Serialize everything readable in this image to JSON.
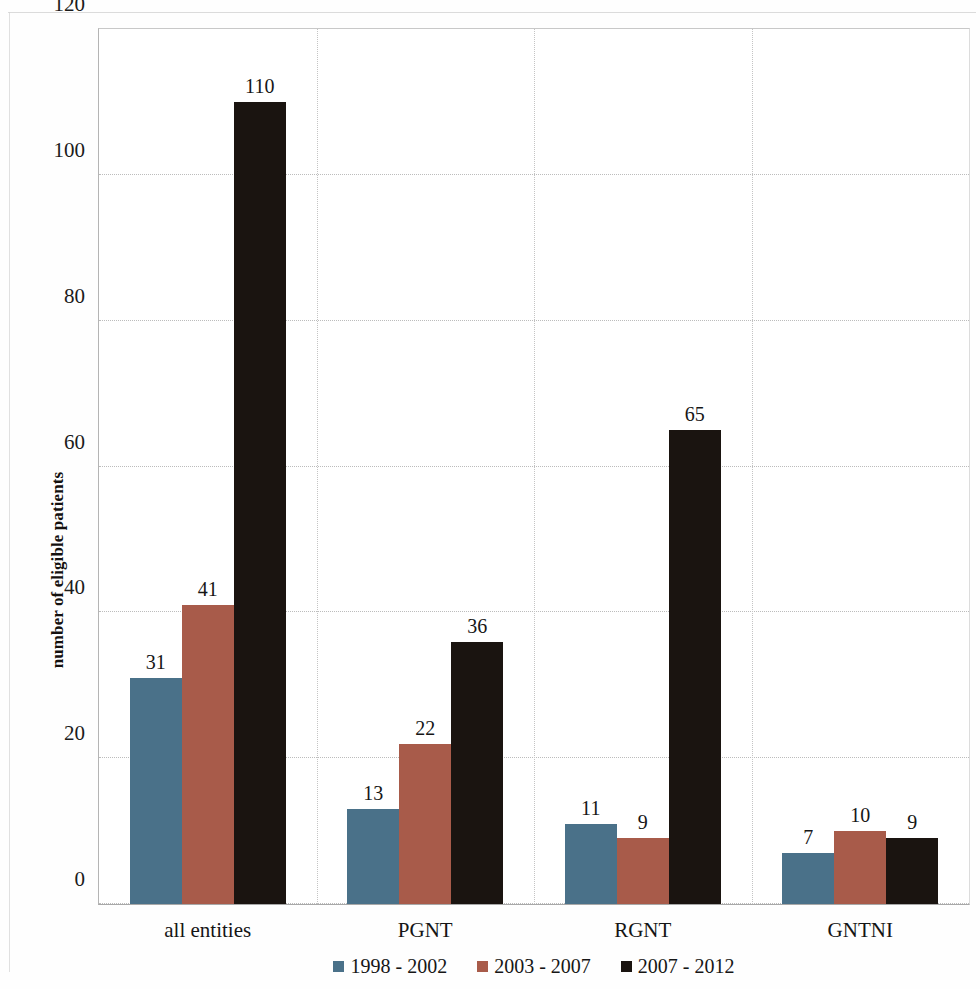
{
  "chart_data": {
    "type": "bar",
    "title": "",
    "subtitle": "",
    "xlabel": "",
    "ylabel": "number of eligible patients",
    "categories": [
      "all  entities",
      "PGNT",
      "RGNT",
      "GNTNI"
    ],
    "series": [
      {
        "name": "1998 - 2002",
        "color": "#4a7189",
        "values": [
          31,
          13,
          11,
          7
        ]
      },
      {
        "name": "2003 - 2007",
        "color": "#a85b4a",
        "values": [
          41,
          22,
          9,
          10
        ]
      },
      {
        "name": "2007 - 2012",
        "color": "#1a1410",
        "values": [
          110,
          36,
          65,
          9
        ]
      }
    ],
    "ylim": [
      0,
      120
    ],
    "yticks": [
      0,
      20,
      40,
      60,
      80,
      100,
      120
    ],
    "ytick_labels": [
      "0",
      "20",
      "40",
      "60",
      "80",
      "100",
      "120"
    ],
    "grid": {
      "horizontal": true,
      "vertical": true
    },
    "legend_position": "bottom",
    "data_labels": true,
    "annotations": []
  },
  "legend": {
    "items": [
      {
        "label": "1998 - 2002",
        "color": "#4a7189"
      },
      {
        "label": "2003 - 2007",
        "color": "#a85b4a"
      },
      {
        "label": "2007 - 2012",
        "color": "#1a1410"
      }
    ]
  }
}
